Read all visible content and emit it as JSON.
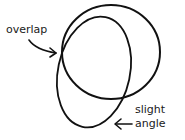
{
  "diagram": {
    "labels": {
      "overlap": "overlap",
      "slight": "slight",
      "angle": "angle"
    },
    "shapes": [
      {
        "type": "circle",
        "cx": 111,
        "cy": 52,
        "rx": 49,
        "ry": 47,
        "rotation": 0
      },
      {
        "type": "ellipse",
        "cx": 94,
        "cy": 72,
        "rx": 36,
        "ry": 56,
        "rotation": 12
      }
    ],
    "annotations": [
      {
        "text": "overlap",
        "points_to": "intersection of circle and ellipse (left)"
      },
      {
        "text": "slight angle",
        "points_to": "tilted ellipse (bottom)"
      }
    ],
    "stroke_color": "#111111",
    "text_color": "#1a1a1a"
  }
}
